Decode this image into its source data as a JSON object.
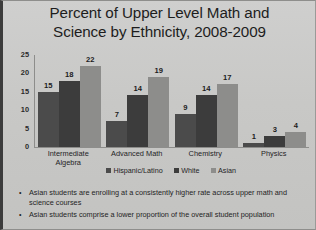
{
  "slide": {
    "title_line1": "Percent of Upper Level Math and",
    "title_line2": "Science by Ethnicity, 2008-2009"
  },
  "chart_data": {
    "type": "bar",
    "title": "Percent of Upper Level Math and Science by Ethnicity, 2008-2009",
    "xlabel": "",
    "ylabel": "",
    "ylim": [
      0,
      25
    ],
    "yticks": [
      25,
      20,
      15,
      10,
      5,
      0
    ],
    "grid": false,
    "legend_position": "bottom",
    "categories": [
      "Intermediate Algebra",
      "Advanced Math",
      "Chemistry",
      "Physics"
    ],
    "category_lines": [
      [
        "Intermediate",
        "Algebra"
      ],
      [
        "Advanced Math"
      ],
      [
        "Chemistry"
      ],
      [
        "Physics"
      ]
    ],
    "series": [
      {
        "name": "Hispanic/Latino",
        "color": "#4b4b4b",
        "values": [
          15,
          7,
          9,
          1
        ]
      },
      {
        "name": "White",
        "color": "#3c3c3c",
        "values": [
          18,
          14,
          14,
          3
        ]
      },
      {
        "name": "Asian",
        "color": "#8d8d8b",
        "values": [
          22,
          19,
          17,
          4
        ]
      }
    ]
  },
  "bullets": [
    "Asian students are enrolling at a consistently higher rate across upper math and science courses",
    "Asian students comprise a lower proportion of the overall student population"
  ],
  "bullet_marker": "•"
}
